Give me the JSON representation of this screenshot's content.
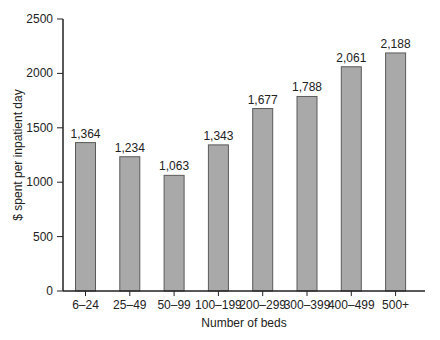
{
  "chart_data": {
    "type": "bar",
    "title": "",
    "xlabel": "Number of beds",
    "ylabel": "$ spent per inpatient day",
    "categories": [
      "6–24",
      "25–49",
      "50–99",
      "100–199",
      "200–299",
      "300–399",
      "400–499",
      "500+"
    ],
    "values": [
      1364,
      1234,
      1063,
      1343,
      1677,
      1788,
      2061,
      2188
    ],
    "data_labels": [
      "1,364",
      "1,234",
      "1,063",
      "1,343",
      "1,677",
      "1,788",
      "2,061",
      "2,188"
    ],
    "ylim": [
      0,
      2500
    ],
    "yticks": [
      0,
      500,
      1000,
      1500,
      2000,
      2500
    ],
    "ytick_labels": [
      "0",
      "500",
      "1000",
      "1500",
      "2000",
      "2500"
    ],
    "grid": false,
    "legend": null,
    "colors": {
      "bar_fill": "#a9a9a9",
      "bar_stroke": "#5a5a5a",
      "axis": "#222222"
    }
  }
}
